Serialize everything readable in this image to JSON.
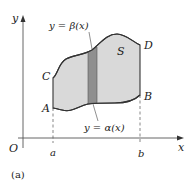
{
  "figure": {
    "caption": "(a)",
    "axes": {
      "x_label": "x",
      "y_label": "y",
      "origin_label": "O",
      "x_ticks": [
        "a",
        "b"
      ]
    },
    "points": {
      "A": "A",
      "B": "B",
      "C": "C",
      "D": "D"
    },
    "region_label": "S",
    "curves": {
      "upper": "y = β(x)",
      "lower": "y = α(x)"
    },
    "colors": {
      "region_fill": "#d9d9d9",
      "strip_fill": "#8f8f8f",
      "stroke": "#333333",
      "axis": "#555555"
    }
  }
}
